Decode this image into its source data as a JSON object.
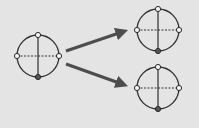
{
  "diagram": {
    "background": "#e4e4e4",
    "stroke_color": "#2e2e2e",
    "arrow_color": "#4d4d4d",
    "node_fill_open": "#f2f2f2",
    "node_fill_filled": "#555555",
    "circles": [
      {
        "id": "source",
        "cx": 38,
        "cy": 56,
        "r": 21
      },
      {
        "id": "target-top",
        "cx": 158,
        "cy": 30,
        "r": 21
      },
      {
        "id": "target-bottom",
        "cx": 158,
        "cy": 88,
        "r": 21
      }
    ],
    "arrows": [
      {
        "id": "arrow-up",
        "x1": 66,
        "y1": 51,
        "x2": 127,
        "y2": 30
      },
      {
        "id": "arrow-down",
        "x1": 66,
        "y1": 64,
        "x2": 127,
        "y2": 86
      }
    ]
  }
}
